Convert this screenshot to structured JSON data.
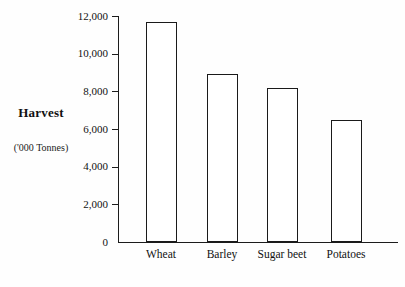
{
  "chart_data": {
    "type": "bar",
    "title": "",
    "ylabel_main": "Harvest",
    "ylabel_sub": "('000 Tonnes)",
    "categories": [
      "Wheat",
      "Barley",
      "Sugar beet",
      "Potatoes"
    ],
    "values": [
      11700,
      8900,
      8200,
      6500
    ],
    "ylim": [
      0,
      12000
    ],
    "yticks": [
      {
        "value": 0,
        "label": "0"
      },
      {
        "value": 2000,
        "label": "2,000"
      },
      {
        "value": 4000,
        "label": "4,000"
      },
      {
        "value": 6000,
        "label": "6,000"
      },
      {
        "value": 8000,
        "label": "8,000"
      },
      {
        "value": 10000,
        "label": "10,000"
      },
      {
        "value": 12000,
        "label": "12,000"
      }
    ],
    "legend": null,
    "grid": false,
    "bar_fill": "#ffffff",
    "bar_border": "#1a1a1a",
    "axis_color": "#1c1c1c",
    "background": "#fefefe"
  }
}
